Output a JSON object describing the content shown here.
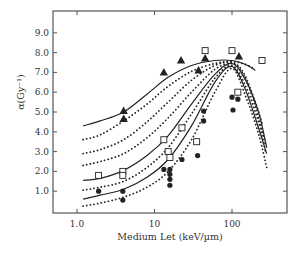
{
  "chart_data": {
    "type": "scatter",
    "title": "",
    "xlabel": "Medium Let (keV/µm)",
    "ylabel": "α(Gy⁻¹)",
    "xscale": "log",
    "xlim": [
      0.5,
      400
    ],
    "ylim": [
      0,
      10
    ],
    "xticks": [
      1.0,
      10,
      100
    ],
    "xtick_labels": [
      "1.0",
      "10",
      "100"
    ],
    "yticks": [
      1,
      2,
      3,
      4,
      5,
      6,
      7,
      8,
      9
    ],
    "ytick_labels": [
      "1.0",
      "2.0",
      "3.0",
      "4.0",
      "5.0",
      "6.0",
      "7.0",
      "8.0",
      "9.0"
    ],
    "grid": false,
    "legend": "none",
    "series": [
      {
        "name": "triangles",
        "marker": "filled-triangle",
        "points": [
          [
            4.0,
            5.05
          ],
          [
            4.0,
            4.65
          ],
          [
            13.2,
            7.0
          ],
          [
            22,
            7.6
          ],
          [
            37,
            7.1
          ],
          [
            45,
            7.7
          ],
          [
            123,
            7.8
          ]
        ]
      },
      {
        "name": "squares",
        "marker": "open-square",
        "points": [
          [
            1.9,
            1.8
          ],
          [
            3.9,
            2.0
          ],
          [
            3.9,
            1.8
          ],
          [
            13.2,
            3.6
          ],
          [
            15,
            3.0
          ],
          [
            15.8,
            2.7
          ],
          [
            22.6,
            4.2
          ],
          [
            35,
            3.5
          ],
          [
            45,
            8.1
          ],
          [
            100,
            8.1
          ],
          [
            119,
            6.0
          ],
          [
            244,
            7.6
          ]
        ]
      },
      {
        "name": "circles",
        "marker": "filled-circle",
        "points": [
          [
            1.9,
            1.0
          ],
          [
            3.9,
            1.0
          ],
          [
            3.9,
            0.55
          ],
          [
            13.2,
            2.1
          ],
          [
            15.8,
            2.1
          ],
          [
            15.8,
            1.85
          ],
          [
            15.8,
            1.6
          ],
          [
            15.8,
            1.3
          ],
          [
            22.6,
            2.6
          ],
          [
            36,
            2.8
          ],
          [
            43,
            5.05
          ],
          [
            43,
            4.55
          ],
          [
            100,
            5.75
          ],
          [
            103,
            5.1
          ],
          [
            119,
            5.65
          ]
        ]
      }
    ],
    "curves": [
      {
        "style": "solid",
        "points": [
          [
            1.2,
            4.3
          ],
          [
            2,
            4.55
          ],
          [
            4,
            5.0
          ],
          [
            8,
            5.9
          ],
          [
            15,
            6.75
          ],
          [
            30,
            7.35
          ],
          [
            60,
            7.6
          ],
          [
            100,
            7.6
          ],
          [
            150,
            7.4
          ],
          [
            200,
            7.1
          ]
        ]
      },
      {
        "style": "dotted",
        "points": [
          [
            1.2,
            3.6
          ],
          [
            2,
            3.85
          ],
          [
            4,
            4.55
          ],
          [
            8,
            5.4
          ],
          [
            15,
            6.3
          ],
          [
            30,
            7.05
          ],
          [
            60,
            7.45
          ],
          [
            100,
            7.55
          ],
          [
            150,
            7.4
          ],
          [
            200,
            7.15
          ]
        ]
      },
      {
        "style": "dotted",
        "points": [
          [
            1.2,
            2.9
          ],
          [
            2,
            3.1
          ],
          [
            4,
            3.6
          ],
          [
            8,
            4.5
          ],
          [
            15,
            5.5
          ],
          [
            30,
            6.6
          ],
          [
            60,
            7.35
          ],
          [
            100,
            7.5
          ],
          [
            140,
            7.0
          ],
          [
            200,
            5.5
          ],
          [
            250,
            4.3
          ]
        ]
      },
      {
        "style": "dotted",
        "points": [
          [
            1.2,
            2.3
          ],
          [
            2,
            2.5
          ],
          [
            4,
            2.9
          ],
          [
            8,
            3.7
          ],
          [
            15,
            4.7
          ],
          [
            30,
            6.0
          ],
          [
            60,
            7.15
          ],
          [
            100,
            7.45
          ],
          [
            140,
            6.9
          ],
          [
            200,
            5.3
          ],
          [
            270,
            3.4
          ]
        ]
      },
      {
        "style": "solid",
        "points": [
          [
            1.2,
            1.55
          ],
          [
            2,
            1.65
          ],
          [
            4,
            2.05
          ],
          [
            8,
            2.8
          ],
          [
            15,
            3.8
          ],
          [
            30,
            5.4
          ],
          [
            60,
            6.9
          ],
          [
            100,
            7.45
          ],
          [
            150,
            6.6
          ],
          [
            220,
            5.0
          ],
          [
            280,
            3.2
          ]
        ]
      },
      {
        "style": "dotted",
        "points": [
          [
            1.2,
            1.05
          ],
          [
            2,
            1.2
          ],
          [
            4,
            1.5
          ],
          [
            8,
            2.2
          ],
          [
            15,
            3.2
          ],
          [
            30,
            4.9
          ],
          [
            60,
            6.7
          ],
          [
            100,
            7.35
          ],
          [
            150,
            6.3
          ],
          [
            220,
            4.5
          ],
          [
            270,
            3.0
          ]
        ]
      },
      {
        "style": "solid",
        "points": [
          [
            1.2,
            0.6
          ],
          [
            2,
            0.8
          ],
          [
            4,
            1.1
          ],
          [
            8,
            1.7
          ],
          [
            15,
            2.6
          ],
          [
            30,
            4.3
          ],
          [
            60,
            6.5
          ],
          [
            100,
            7.3
          ],
          [
            150,
            6.1
          ],
          [
            220,
            4.2
          ],
          [
            280,
            2.9
          ]
        ]
      },
      {
        "style": "dotted",
        "points": [
          [
            1.2,
            0.25
          ],
          [
            2,
            0.4
          ],
          [
            4,
            0.7
          ],
          [
            8,
            1.2
          ],
          [
            15,
            2.0
          ],
          [
            30,
            3.6
          ],
          [
            60,
            6.0
          ],
          [
            100,
            7.2
          ],
          [
            150,
            5.8
          ],
          [
            220,
            3.9
          ],
          [
            280,
            2.2
          ]
        ]
      }
    ],
    "colors": {
      "line": "#222222",
      "axis": "#555555",
      "text": "#333333",
      "background": "#ffffff"
    }
  }
}
